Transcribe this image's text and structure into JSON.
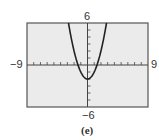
{
  "chart_data": {
    "type": "line",
    "title": "",
    "caption": "(e)",
    "function": "y = x^2 - 2",
    "xlim": [
      -9,
      9
    ],
    "ylim": [
      -6,
      6
    ],
    "xtick_step": 1,
    "ytick_step": 1,
    "x_labels": {
      "min": "−9",
      "max": "9"
    },
    "y_labels": {
      "min": "−6",
      "max": "6"
    },
    "grid": false,
    "series": [
      {
        "name": "parabola",
        "x": [
          -2.83,
          -2.5,
          -2,
          -1.5,
          -1.41,
          -1,
          -0.5,
          0,
          0.5,
          1,
          1.41,
          1.5,
          2,
          2.5,
          2.83
        ],
        "y": [
          6,
          4.25,
          2,
          0.25,
          0,
          -1,
          -1.75,
          -2,
          -1.75,
          -1,
          0,
          0.25,
          2,
          4.25,
          6
        ]
      }
    ],
    "colors": {
      "plot_bg": "#ebebeb",
      "frame": "#555555",
      "curve": "#222222",
      "axes": "#444444"
    }
  }
}
